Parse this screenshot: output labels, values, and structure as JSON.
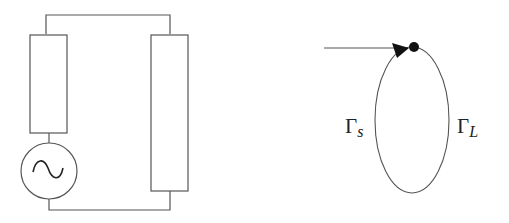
{
  "circuit": {
    "components": [
      "source-resistor",
      "ac-voltage-source",
      "load-resistor"
    ],
    "source_symbol": "~"
  },
  "signal_flow_graph": {
    "source_label": {
      "base": "Γ",
      "sub": "s"
    },
    "load_label": {
      "base": "Γ",
      "sub": "L"
    }
  },
  "colors": {
    "stroke": "#555555",
    "fill": "#111111",
    "background": "#ffffff"
  }
}
